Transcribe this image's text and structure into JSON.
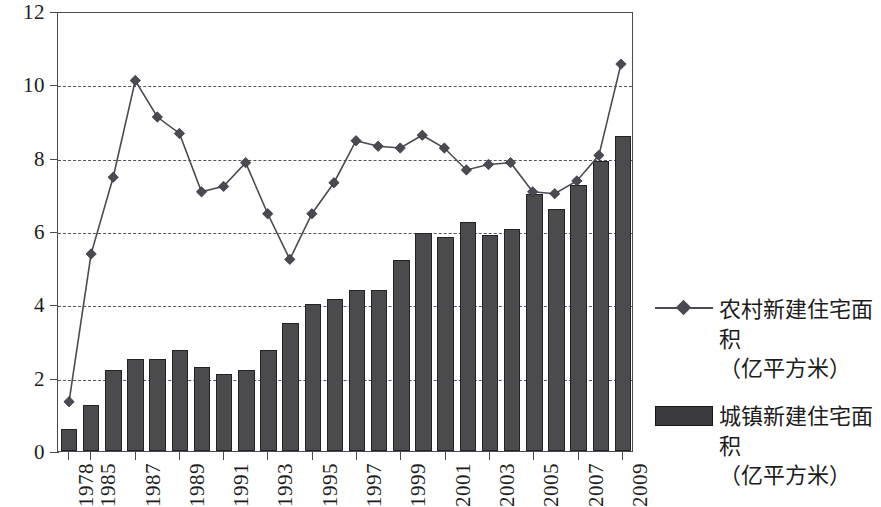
{
  "chart_data": {
    "type": "bar",
    "title": "",
    "subtitle": "",
    "xlabel": "",
    "ylabel": "",
    "ylim": [
      0,
      12
    ],
    "ytick_values": [
      0,
      2,
      4,
      6,
      8,
      10,
      12
    ],
    "ytick_labels": [
      "0",
      "2",
      "4",
      "6",
      "8",
      "10",
      "12"
    ],
    "grid": "horizontal-dashed",
    "legend_position": "right",
    "categories": [
      "1978",
      "1985",
      "1986",
      "1987",
      "1988",
      "1989",
      "1990",
      "1991",
      "1992",
      "1993",
      "1994",
      "1995",
      "1996",
      "1997",
      "1998",
      "1999",
      "2000",
      "2001",
      "2002",
      "2003",
      "2004",
      "2005",
      "2006",
      "2007",
      "2008",
      "2009"
    ],
    "xtick_labels": [
      "1978",
      "1985",
      "1987",
      "1989",
      "1991",
      "1993",
      "1995",
      "1997",
      "1999",
      "2001",
      "2003",
      "2005",
      "2007",
      "2009"
    ],
    "xtick_category_indices": [
      0,
      1,
      3,
      5,
      7,
      9,
      11,
      13,
      15,
      17,
      19,
      21,
      23,
      25
    ],
    "series": [
      {
        "name": "农村新建住宅面积（亿平方米）",
        "type": "line",
        "marker": "diamond",
        "color": "#4a4a52",
        "values": [
          1.35,
          5.4,
          7.5,
          10.15,
          9.15,
          8.7,
          7.1,
          7.25,
          7.9,
          6.5,
          5.25,
          6.5,
          7.35,
          8.5,
          8.35,
          8.3,
          8.65,
          8.3,
          7.7,
          7.85,
          7.9,
          7.1,
          7.05,
          7.4,
          8.1,
          10.6
        ]
      },
      {
        "name": "城镇新建住宅面积（亿平方米）",
        "type": "bar",
        "color": "#4b4b4e",
        "values": [
          0.6,
          1.25,
          2.2,
          2.5,
          2.5,
          2.75,
          2.3,
          2.1,
          2.2,
          2.75,
          3.5,
          4.0,
          4.15,
          4.4,
          4.4,
          5.2,
          5.95,
          5.85,
          6.25,
          5.9,
          6.05,
          7.0,
          6.6,
          7.25,
          7.9,
          8.6
        ]
      }
    ]
  },
  "legend": {
    "entries": [
      {
        "key": "line-diamond",
        "line1": "农村新建住宅面积",
        "line2": "（亿平方米）"
      },
      {
        "key": "bar-swatch",
        "line1": "城镇新建住宅面积",
        "line2": "（亿平方米）"
      }
    ]
  },
  "colors": {
    "bar": "#4b4b4e",
    "line": "#4a4a52",
    "axis": "#4a4a52",
    "grid": "#54545c",
    "text": "#1c1c20",
    "background": "#ffffff"
  }
}
